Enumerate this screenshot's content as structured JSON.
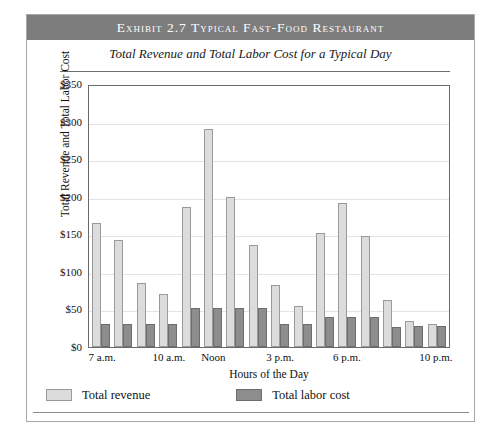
{
  "exhibit": {
    "banner_title": "Exhibit 2.7   Typical Fast-Food Restaurant",
    "subtitle": "Total Revenue and Total Labor Cost for a Typical Day"
  },
  "legend": {
    "revenue_label": "Total revenue",
    "labor_label": "Total labor cost"
  },
  "colors": {
    "banner_background": "#7d7d7d",
    "banner_text": "#ffffff",
    "revenue_bar": "#dcdcdc",
    "revenue_bar_edge": "#9a9a9a",
    "labor_bar": "#8d8d8d",
    "labor_bar_edge": "#6d6d6d",
    "gridline": "#e3e3e3",
    "axis": "#6a6a6a"
  },
  "chart_data": {
    "type": "bar",
    "title": "Total Revenue and Total Labor Cost for a Typical Day",
    "xlabel": "Hours of the Day",
    "ylabel": "Total Revenue and Total Labor Cost",
    "ylim": [
      0,
      350
    ],
    "yticks": [
      "$0",
      "$50",
      "$100",
      "$150",
      "$200",
      "$250",
      "$300",
      "$350"
    ],
    "ytick_values": [
      0,
      50,
      100,
      150,
      200,
      250,
      300,
      350
    ],
    "grid": true,
    "legend_position": "below",
    "categories": [
      "7 a.m.",
      "8 a.m.",
      "9 a.m.",
      "10 a.m.",
      "11 a.m.",
      "Noon",
      "1 p.m.",
      "2 p.m.",
      "3 p.m.",
      "4 p.m.",
      "5 p.m.",
      "6 p.m.",
      "7 p.m.",
      "8 p.m.",
      "9 p.m.",
      "10 p.m."
    ],
    "xtick_labels": [
      "7 a.m.",
      "10 a.m.",
      "Noon",
      "3 p.m.",
      "6 p.m.",
      "10 p.m."
    ],
    "xtick_indices": [
      0,
      3,
      5,
      8,
      11,
      15
    ],
    "series": [
      {
        "name": "Total revenue",
        "values": [
          165,
          142,
          85,
          70,
          186,
          290,
          200,
          136,
          82,
          55,
          152,
          191,
          148,
          62,
          35,
          30
        ]
      },
      {
        "name": "Total labor cost",
        "values": [
          30,
          30,
          30,
          30,
          52,
          52,
          52,
          52,
          30,
          30,
          40,
          40,
          40,
          27,
          28,
          28
        ]
      }
    ]
  }
}
